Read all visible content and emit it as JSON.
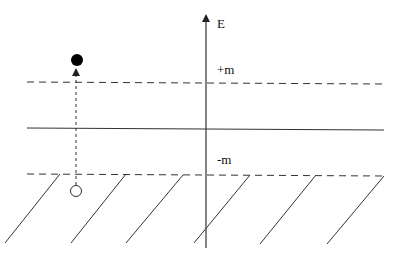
{
  "diagram": {
    "colors": {
      "line": "#222222",
      "background": "#ffffff"
    },
    "axis": {
      "label": "E",
      "x": 206,
      "y_top": 14,
      "y_bottom": 248
    },
    "levels": [
      {
        "name": "upper-gap-edge",
        "label": "+m",
        "y": 83,
        "style": "dashed"
      },
      {
        "name": "zero-energy",
        "label": "",
        "y": 129,
        "style": "solid"
      },
      {
        "name": "lower-gap-edge",
        "label": "-m",
        "y": 175,
        "style": "dashed"
      }
    ],
    "particle": {
      "type": "filled-circle",
      "cx": 77,
      "cy": 60,
      "r": 6
    },
    "hole": {
      "type": "open-circle",
      "cx": 76,
      "cy": 191,
      "r": 6
    },
    "excitation_arrow": {
      "x": 76,
      "y_from": 185,
      "y_to": 68,
      "style": "dotted"
    },
    "hatch_lines": [
      {
        "x1": 60,
        "y1": 174,
        "x2": 5,
        "y2": 243
      },
      {
        "x1": 126,
        "y1": 174,
        "x2": 71,
        "y2": 243
      },
      {
        "x1": 183,
        "y1": 175,
        "x2": 126,
        "y2": 243
      },
      {
        "x1": 250,
        "y1": 175,
        "x2": 194,
        "y2": 243
      },
      {
        "x1": 316,
        "y1": 175,
        "x2": 260,
        "y2": 244
      },
      {
        "x1": 384,
        "y1": 176,
        "x2": 327,
        "y2": 244
      }
    ],
    "labels": {
      "axis": "E",
      "plus_m": "+m",
      "minus_m": "-m"
    }
  }
}
